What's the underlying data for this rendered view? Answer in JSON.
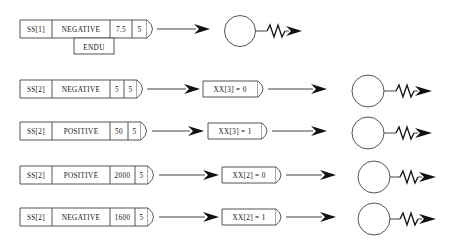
{
  "diagram": {
    "colors": {
      "background": "#ffffff",
      "box_border": "#555555",
      "text": "#111111",
      "wire": "#444444",
      "arrow": "#111111"
    },
    "rows": [
      {
        "id": "row-1",
        "cells": [
          "SS[1]",
          "NEGATIVE",
          "7.5",
          "5"
        ],
        "sub_box": "ENDU",
        "condition_box": null,
        "has_circle": true,
        "has_resistor": true
      },
      {
        "id": "row-2",
        "cells": [
          "SS[2]",
          "NEGATIVE",
          "5",
          "5"
        ],
        "sub_box": null,
        "condition_box": "XX[3] = 0",
        "has_circle": true,
        "has_resistor": true
      },
      {
        "id": "row-3",
        "cells": [
          "SS[2]",
          "POSITIVE",
          "50",
          "5"
        ],
        "sub_box": null,
        "condition_box": "XX[3] = 1",
        "has_circle": true,
        "has_resistor": true
      },
      {
        "id": "row-4",
        "cells": [
          "SS[2]",
          "POSITIVE",
          "2000",
          "5"
        ],
        "sub_box": null,
        "condition_box": "XX[2] = 0",
        "has_circle": true,
        "has_resistor": true
      },
      {
        "id": "row-5",
        "cells": [
          "SS[2]",
          "NEGATIVE",
          "1600",
          "5"
        ],
        "sub_box": null,
        "condition_box": "XX[2] = 1",
        "has_circle": true,
        "has_resistor": true
      }
    ]
  }
}
